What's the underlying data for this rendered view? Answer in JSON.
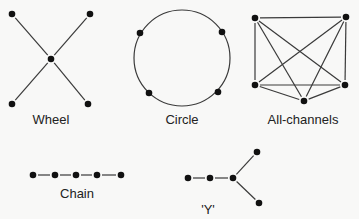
{
  "diagram": {
    "colors": {
      "background": "#f8f8f7",
      "edge": "#3a3a3a",
      "node": "#111111",
      "label": "#222222"
    },
    "networks": [
      {
        "id": "wheel",
        "label": "Wheel",
        "label_pos": [
          51,
          124
        ],
        "nodes": [
          [
            12,
            14
          ],
          [
            90,
            14
          ],
          [
            51,
            59
          ],
          [
            12,
            104
          ],
          [
            88,
            104
          ]
        ],
        "edges": [
          [
            0,
            2
          ],
          [
            1,
            2
          ],
          [
            3,
            2
          ],
          [
            4,
            2
          ]
        ]
      },
      {
        "id": "circle",
        "label": "Circle",
        "label_pos": [
          182,
          124
        ],
        "circle": {
          "cx": 182,
          "cy": 58,
          "r": 48
        },
        "nodes": [
          [
            140,
            33
          ],
          [
            222,
            32
          ],
          [
            149,
            93
          ],
          [
            218,
            92
          ]
        ],
        "edges": []
      },
      {
        "id": "all-channels",
        "label": "All-channels",
        "label_pos": [
          303,
          124
        ],
        "nodes": [
          [
            255,
            18
          ],
          [
            346,
            17
          ],
          [
            255,
            85
          ],
          [
            345,
            85
          ],
          [
            304,
            101
          ]
        ],
        "edges": [
          [
            0,
            1
          ],
          [
            0,
            2
          ],
          [
            1,
            3
          ],
          [
            2,
            3
          ],
          [
            0,
            3
          ],
          [
            1,
            2
          ],
          [
            0,
            4
          ],
          [
            1,
            4
          ],
          [
            2,
            4
          ],
          [
            3,
            4
          ]
        ]
      },
      {
        "id": "chain",
        "label": "Chain",
        "label_pos": [
          77,
          198
        ],
        "nodes": [
          [
            33,
            175
          ],
          [
            55,
            175
          ],
          [
            76,
            175
          ],
          [
            97,
            175
          ],
          [
            121,
            175
          ]
        ],
        "edges": [
          [
            0,
            1
          ],
          [
            1,
            2
          ],
          [
            2,
            3
          ],
          [
            3,
            4
          ]
        ]
      },
      {
        "id": "y",
        "label": "'Y'",
        "label_pos": [
          208,
          214
        ],
        "nodes": [
          [
            188,
            178
          ],
          [
            210,
            178
          ],
          [
            233,
            178
          ],
          [
            257,
            152
          ],
          [
            259,
            203
          ]
        ],
        "edges": [
          [
            0,
            1
          ],
          [
            1,
            2
          ],
          [
            2,
            3
          ],
          [
            2,
            4
          ]
        ]
      }
    ]
  }
}
